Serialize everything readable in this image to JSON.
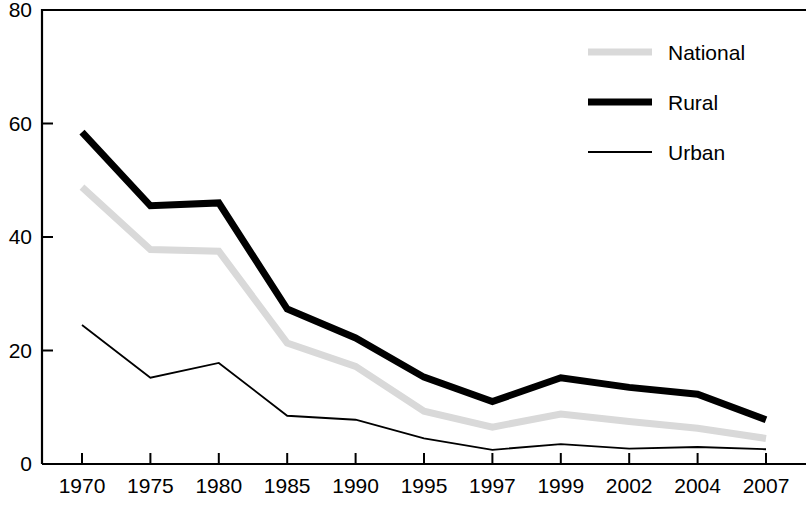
{
  "chart_data": {
    "type": "line",
    "title": "",
    "subtitle": "",
    "xlabel": "",
    "ylabel": "",
    "categories": [
      "1970",
      "1975",
      "1980",
      "1985",
      "1990",
      "1995",
      "1997",
      "1999",
      "2002",
      "2004",
      "2007"
    ],
    "xlim": [
      0,
      10
    ],
    "ylim": [
      0,
      80
    ],
    "y_ticks": [
      0,
      20,
      40,
      60,
      80
    ],
    "y_tick_labels": [
      "0",
      "20",
      "40",
      "60",
      "80"
    ],
    "x_tick_labels": [
      "1970",
      "1975",
      "1980",
      "1985",
      "1990",
      "1995",
      "1997",
      "1999",
      "2002",
      "2004",
      "2007"
    ],
    "grid": false,
    "legend_position": "top-right",
    "series": [
      {
        "name": "National",
        "color": "#d9d9d9",
        "width": 7,
        "values": [
          48.8,
          37.8,
          37.5,
          21.3,
          17.2,
          9.3,
          6.5,
          8.8,
          7.5,
          6.3,
          4.5
        ]
      },
      {
        "name": "Rural",
        "color": "#000000",
        "width": 7,
        "values": [
          58.5,
          45.5,
          46.0,
          27.3,
          22.2,
          15.3,
          11.0,
          15.2,
          13.5,
          12.3,
          7.8
        ]
      },
      {
        "name": "Urban",
        "color": "#000000",
        "width": 1.8,
        "values": [
          24.5,
          15.2,
          17.8,
          8.5,
          7.8,
          4.5,
          2.5,
          3.5,
          2.7,
          3.0,
          2.6
        ]
      }
    ]
  },
  "legend": {
    "entries": [
      {
        "label": "National"
      },
      {
        "label": "Rural"
      },
      {
        "label": "Urban"
      }
    ]
  },
  "axes": {
    "left_axis_name": "y-axis",
    "bottom_axis_name": "x-axis"
  }
}
